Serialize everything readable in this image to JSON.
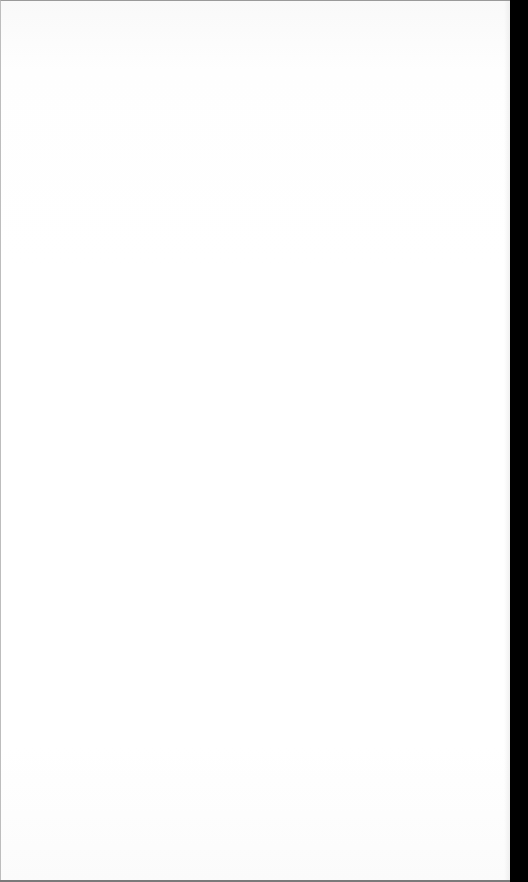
{
  "page": {
    "text": ""
  },
  "colors": {
    "page_background": "#ffffff",
    "edge_strip": "#000000",
    "border": "#9a9a9a"
  }
}
